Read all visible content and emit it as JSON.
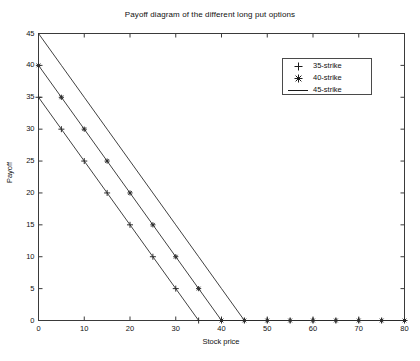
{
  "chart_data": {
    "type": "line",
    "title": "Payoff diagram of the different long put options",
    "xlabel": "Stock price",
    "ylabel": "Payoff",
    "xlim": [
      0,
      80
    ],
    "ylim": [
      0,
      45
    ],
    "xticks": [
      0,
      10,
      20,
      30,
      40,
      50,
      60,
      70,
      80
    ],
    "yticks": [
      0,
      5,
      10,
      15,
      20,
      25,
      30,
      35,
      40,
      45
    ],
    "xtick_labels": [
      "0",
      "10",
      "20",
      "30",
      "40",
      "50",
      "60",
      "70",
      "80"
    ],
    "ytick_labels": [
      "0",
      "5",
      "10",
      "15",
      "20",
      "25",
      "30",
      "35",
      "40",
      "45"
    ],
    "grid": false,
    "legend_position": "upper right",
    "x": [
      0,
      5,
      10,
      15,
      20,
      25,
      30,
      35,
      40,
      45,
      50,
      55,
      60,
      65,
      70,
      75,
      80
    ],
    "series": [
      {
        "name": "35-strike",
        "marker": "+",
        "strike": 35,
        "values": [
          35,
          30,
          25,
          20,
          15,
          10,
          5,
          0,
          0,
          0,
          0,
          0,
          0,
          0,
          0,
          0,
          0
        ]
      },
      {
        "name": "40-strike",
        "marker": "*",
        "strike": 40,
        "values": [
          40,
          35,
          30,
          25,
          20,
          15,
          10,
          5,
          0,
          0,
          0,
          0,
          0,
          0,
          0,
          0,
          0
        ]
      },
      {
        "name": "45-strike",
        "marker": "-",
        "strike": 45,
        "values": [
          45,
          40,
          35,
          30,
          25,
          20,
          15,
          10,
          5,
          0,
          0,
          0,
          0,
          0,
          0,
          0,
          0
        ]
      }
    ],
    "line_color": "#2b2b2b",
    "axis_color": "#3a3a3a",
    "background_color": "#ffffff"
  },
  "legend": {
    "entries": [
      {
        "symbol": "+",
        "label": "35-strike"
      },
      {
        "symbol": "*",
        "label": "40-strike"
      },
      {
        "symbol": "—",
        "label": "45-strike"
      }
    ]
  }
}
